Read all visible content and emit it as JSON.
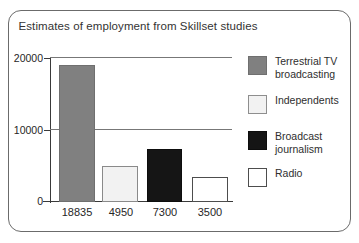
{
  "chart_data": {
    "type": "bar",
    "title": "Estimates of employment from Skillset studies",
    "xlabel": "",
    "ylabel": "",
    "ylim": [
      0,
      20000
    ],
    "yticks": [
      0,
      10000,
      20000
    ],
    "ytick_labels": [
      "0",
      "10000",
      "20000"
    ],
    "grid": true,
    "legend_position": "right",
    "categories": [
      "18835",
      "4950",
      "7300",
      "3500"
    ],
    "values": [
      18835,
      4950,
      7300,
      3500
    ],
    "bars": [
      {
        "label": "18835",
        "value": 18835,
        "series": "Terrestrial TV broadcasting",
        "color": "#808080"
      },
      {
        "label": "4950",
        "value": 4950,
        "series": "Independents",
        "color": "#f2f2f2"
      },
      {
        "label": "7300",
        "value": 7300,
        "series": "Broadcast journalism",
        "color": "#151515"
      },
      {
        "label": "3500",
        "value": 3500,
        "series": "Radio",
        "color": "#ffffff"
      }
    ],
    "legend": [
      {
        "label": "Terrestrial TV\nbroadcasting",
        "color": "#808080"
      },
      {
        "label": "Independents",
        "color": "#f2f2f2"
      },
      {
        "label": "Broadcast\njournalism",
        "color": "#151515"
      },
      {
        "label": "Radio",
        "color": "#ffffff"
      }
    ]
  }
}
